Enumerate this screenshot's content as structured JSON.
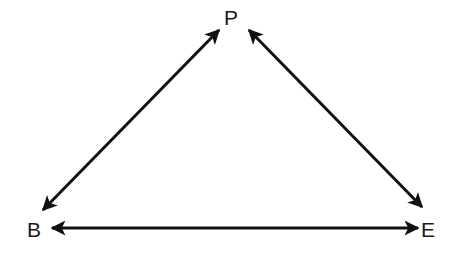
{
  "diagram": {
    "type": "triangle-relationship",
    "nodes": [
      {
        "id": "P",
        "label": "P",
        "x": 231,
        "y": 17
      },
      {
        "id": "B",
        "label": "B",
        "x": 34,
        "y": 229
      },
      {
        "id": "E",
        "label": "E",
        "x": 428,
        "y": 229
      }
    ],
    "edges": [
      {
        "from": "B",
        "to": "P",
        "bidirectional": true,
        "x1": 43,
        "y1": 210,
        "x2": 219,
        "y2": 30
      },
      {
        "from": "P",
        "to": "E",
        "bidirectional": true,
        "x1": 249,
        "y1": 30,
        "x2": 422,
        "y2": 207
      },
      {
        "from": "B",
        "to": "E",
        "bidirectional": true,
        "x1": 52,
        "y1": 228,
        "x2": 418,
        "y2": 228
      }
    ],
    "colors": {
      "stroke": "#111111",
      "text": "#1a1a1a",
      "background": "#ffffff"
    }
  }
}
